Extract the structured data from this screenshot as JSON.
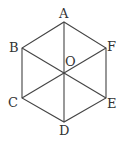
{
  "diagram": {
    "labels": {
      "A": "A",
      "B": "B",
      "C": "C",
      "D": "D",
      "E": "E",
      "F": "F",
      "O": "O"
    },
    "points": {
      "A": [
        64,
        22
      ],
      "B": [
        22,
        48
      ],
      "C": [
        22,
        98
      ],
      "D": [
        64,
        122
      ],
      "E": [
        106,
        98
      ],
      "F": [
        106,
        48
      ],
      "O": [
        64,
        72
      ]
    },
    "edges": [
      [
        "A",
        "B"
      ],
      [
        "B",
        "C"
      ],
      [
        "C",
        "D"
      ],
      [
        "D",
        "E"
      ],
      [
        "E",
        "F"
      ],
      [
        "F",
        "A"
      ],
      [
        "A",
        "D"
      ],
      [
        "B",
        "E"
      ],
      [
        "C",
        "F"
      ]
    ],
    "line_color": "#444444"
  }
}
